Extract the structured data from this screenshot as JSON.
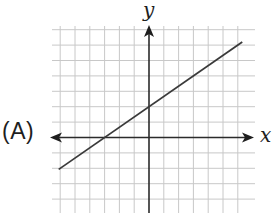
{
  "choice_label": "(A)",
  "axes": {
    "x_label": "x",
    "y_label": "y"
  },
  "colors": {
    "grid": "#c8c8c8",
    "axis": "#2b2b2b",
    "line": "#3a3a3a",
    "background": "#ffffff"
  },
  "chart_data": {
    "type": "line",
    "title": "",
    "xlabel": "x",
    "ylabel": "y",
    "grid": true,
    "tick_labels": false,
    "legend": null,
    "xlim": [
      -6.5,
      6.8
    ],
    "ylim": [
      -5,
      7.5
    ],
    "grid_step": 1,
    "series": [
      {
        "name": "line",
        "equation": "y = (2/3)x + 2",
        "slope": 0.6667,
        "y_intercept": 2,
        "x_intercept": -3,
        "x": [
          -6.1,
          6.3
        ],
        "y": [
          -2.07,
          6.2
        ]
      }
    ],
    "annotations": [
      "(A)"
    ]
  }
}
